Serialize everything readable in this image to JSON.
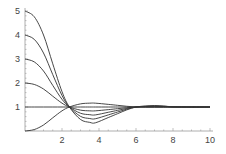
{
  "chart_data": {
    "type": "line",
    "title": "",
    "xlabel": "",
    "ylabel": "",
    "xlim": [
      0,
      10
    ],
    "ylim": [
      0,
      5
    ],
    "grid": false,
    "legend": null,
    "x_ticks": [
      2,
      4,
      6,
      8,
      10
    ],
    "y_ticks": [
      1,
      2,
      3,
      4,
      5
    ],
    "x": [
      0,
      0.5,
      1,
      1.5,
      2,
      2.4,
      3,
      3.5,
      3.8,
      4.5,
      5,
      5.5,
      6,
      6.5,
      7,
      7.5,
      8,
      9,
      10
    ],
    "series": [
      {
        "name": "y0=0",
        "values": [
          0,
          0.06,
          0.25,
          0.55,
          0.84,
          1.0,
          1.13,
          1.16,
          1.16,
          1.11,
          1.07,
          1.03,
          1.0,
          0.99,
          0.99,
          0.99,
          1.0,
          1.0,
          1.0
        ]
      },
      {
        "name": "y0=1",
        "values": [
          1,
          1,
          1,
          1,
          1,
          1,
          1,
          1,
          1,
          1,
          1,
          1,
          1,
          1,
          1,
          1,
          1,
          1,
          1
        ]
      },
      {
        "name": "y0=2",
        "values": [
          2,
          1.94,
          1.75,
          1.45,
          1.16,
          1.0,
          0.87,
          0.84,
          0.84,
          0.89,
          0.93,
          0.97,
          1.0,
          1.01,
          1.01,
          1.01,
          1.0,
          1.0,
          1.0
        ]
      },
      {
        "name": "y0=3",
        "values": [
          3,
          2.88,
          2.5,
          1.9,
          1.32,
          1.0,
          0.74,
          0.68,
          0.67,
          0.78,
          0.86,
          0.94,
          1.0,
          1.02,
          1.03,
          1.02,
          1.0,
          1.0,
          1.0
        ]
      },
      {
        "name": "y0=4",
        "values": [
          4,
          3.82,
          3.25,
          2.35,
          1.48,
          1.0,
          0.61,
          0.52,
          0.51,
          0.67,
          0.79,
          0.91,
          1.0,
          1.03,
          1.04,
          1.03,
          1.01,
          1.0,
          1.0
        ]
      },
      {
        "name": "y0=5",
        "values": [
          5,
          4.76,
          4.0,
          2.8,
          1.64,
          1.0,
          0.48,
          0.36,
          0.34,
          0.56,
          0.72,
          0.88,
          1.0,
          1.04,
          1.06,
          1.04,
          1.01,
          1.0,
          1.0
        ]
      }
    ],
    "annotations": []
  },
  "colors": {
    "line": "#333333",
    "axis": "#999999",
    "text": "#444444",
    "background": "#ffffff"
  }
}
